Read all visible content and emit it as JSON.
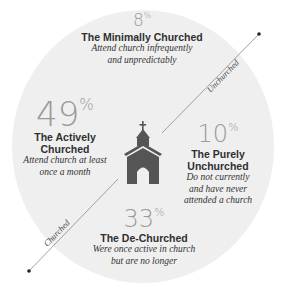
{
  "segments": {
    "minimally": {
      "percent": "8",
      "suffix": "%",
      "title": "The Minimally Churched",
      "desc_1": "Attend church infrequently",
      "desc_2": "and unpredictably"
    },
    "actively": {
      "percent": "49",
      "suffix": "%",
      "title_1": "The Actively",
      "title_2": "Churched",
      "desc_1": "Attend church at least",
      "desc_2": "once a month"
    },
    "purely": {
      "percent": "10",
      "suffix": "%",
      "title_1": "The Purely",
      "title_2": "Unchurched",
      "desc_1": "Do not currently",
      "desc_2": "and have never",
      "desc_3": "attended a church"
    },
    "dechurched": {
      "percent": "33",
      "suffix": "%",
      "title": "The De-Churched",
      "desc_1": "Were once active in church",
      "desc_2": "but are no longer"
    }
  },
  "axis": {
    "upper_label": "Unchurched",
    "lower_label": "Churched"
  },
  "colors": {
    "disc": "#efefef",
    "church": "#555555",
    "line": "#8a8a8a",
    "percent": "#9a9a9a"
  }
}
